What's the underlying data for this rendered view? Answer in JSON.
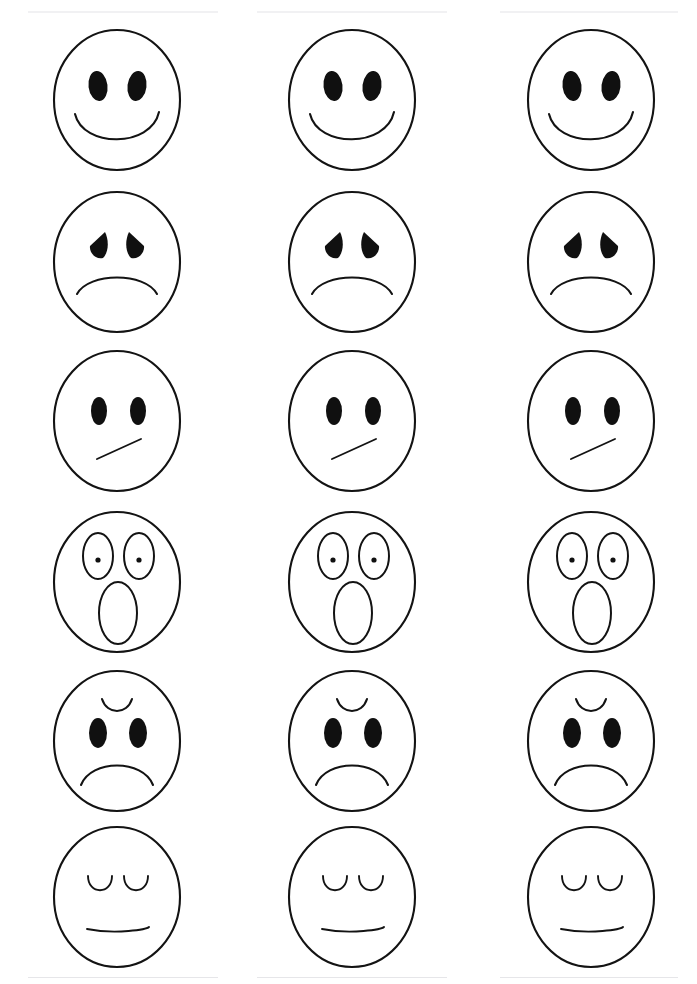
{
  "sheet": {
    "title": "Emotion Faces Practice Sheet",
    "background_color": "#ffffff",
    "ink_color": "#131313",
    "columns": 3,
    "rows": 6,
    "width": 697,
    "height": 984,
    "column_centers": [
      117,
      352,
      591
    ],
    "row_centers": [
      100,
      262,
      421,
      582,
      741,
      897
    ]
  },
  "faces": [
    {
      "row": 1,
      "emotion": "happy",
      "label": "Happy face",
      "eyes": "filled-ovals",
      "mouth": "wide-smile-curve",
      "brow": "none"
    },
    {
      "row": 2,
      "emotion": "sad",
      "label": "Sad face",
      "eyes": "filled-teardrops",
      "mouth": "frown-curve",
      "brow": "none"
    },
    {
      "row": 3,
      "emotion": "skeptical",
      "label": "Skeptical face",
      "eyes": "filled-ovals",
      "mouth": "diagonal-line",
      "brow": "none"
    },
    {
      "row": 4,
      "emotion": "surprised",
      "label": "Surprised face",
      "eyes": "open-ovals-with-dot-pupils",
      "mouth": "large-open-oval",
      "brow": "none"
    },
    {
      "row": 5,
      "emotion": "angry",
      "label": "Angry face",
      "eyes": "filled-ovals",
      "mouth": "deep-frown-curve",
      "brow": "single-furrowed-arc"
    },
    {
      "row": 6,
      "emotion": "sleeping",
      "label": "Sleeping face",
      "eyes": "closed-u-arcs",
      "mouth": "straight-line",
      "brow": "none"
    }
  ],
  "artifacts": [
    {
      "name": "top-edge-smudge",
      "x": 28,
      "y": 11,
      "width": 190,
      "height": 2
    },
    {
      "name": "top-edge-smudge",
      "x": 257,
      "y": 11,
      "width": 190,
      "height": 2
    },
    {
      "name": "top-edge-smudge",
      "x": 500,
      "y": 11,
      "width": 178,
      "height": 2
    },
    {
      "name": "bottom-edge-smudge",
      "x": 28,
      "y": 977,
      "width": 190,
      "height": 2
    },
    {
      "name": "bottom-edge-smudge",
      "x": 257,
      "y": 977,
      "width": 190,
      "height": 2
    },
    {
      "name": "bottom-edge-smudge",
      "x": 500,
      "y": 977,
      "width": 178,
      "height": 2
    }
  ]
}
